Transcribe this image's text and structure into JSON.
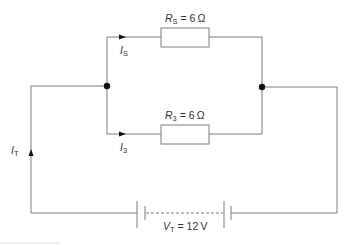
{
  "diagram": {
    "type": "circuit",
    "colors": {
      "wire": "#7a7a7a",
      "junction": "#111111",
      "text": "#333333",
      "footer_line": "#d8d8d8"
    },
    "branches": [
      {
        "id": "top",
        "resistor": {
          "symbol": "R",
          "subscript": "S",
          "value": "6",
          "unit": "Ω"
        },
        "current": {
          "symbol": "I",
          "subscript": "S"
        }
      },
      {
        "id": "bottom",
        "resistor": {
          "symbol": "R",
          "subscript": "3",
          "value": "6",
          "unit": "Ω"
        },
        "current": {
          "symbol": "I",
          "subscript": "3"
        }
      }
    ],
    "total_current": {
      "symbol": "I",
      "subscript": "T"
    },
    "supply": {
      "symbol": "V",
      "subscript": "T",
      "value": "12",
      "unit": "V"
    },
    "eq": " = "
  }
}
